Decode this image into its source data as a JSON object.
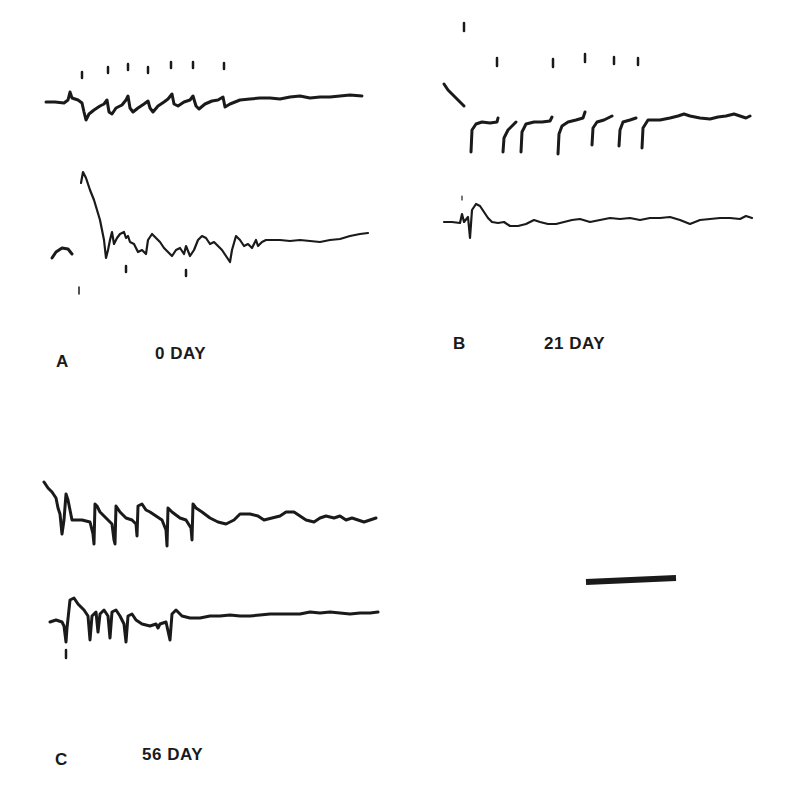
{
  "figure": {
    "panels": [
      {
        "id": "A",
        "letter": "A",
        "title": "0  DAY",
        "traces": [
          "upper",
          "lower"
        ],
        "stimulus_marks": 7
      },
      {
        "id": "B",
        "letter": "B",
        "title": "21 DAY",
        "traces": [
          "upper",
          "lower"
        ],
        "stimulus_marks": 7
      },
      {
        "id": "C",
        "letter": "C",
        "title": "56  DAY",
        "traces": [
          "upper",
          "lower"
        ],
        "stimulus_marks": 0
      }
    ],
    "scale_bar": {
      "present": true
    }
  }
}
